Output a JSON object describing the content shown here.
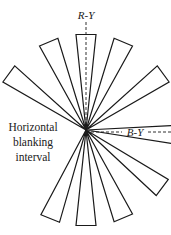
{
  "diagram": {
    "type": "vector-scope-petal-pattern",
    "center": {
      "x": 86,
      "y": 130
    },
    "petal_radius": 96,
    "petal_half_width_deg": 6,
    "petal_angles_deg": [
      -90,
      -67,
      -36,
      3,
      37,
      67,
      90,
      112,
      216,
      247
    ],
    "colors": {
      "stroke": "#1a1a1a",
      "background": "#ffffff"
    }
  },
  "labels": {
    "r_minus_y": "R-Y",
    "b_minus_y": "B-Y",
    "blanking_line1": "Horizontal",
    "blanking_line2": "blanking",
    "blanking_line3": "interval"
  }
}
